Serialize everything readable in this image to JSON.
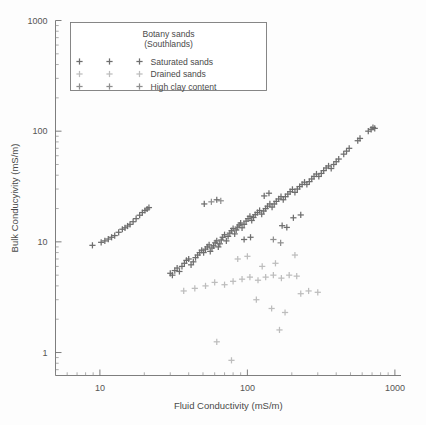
{
  "chart_data": {
    "type": "scatter",
    "title": "",
    "xlabel": "Fluid Conductivity (mS/m)",
    "ylabel": "Bulk Conducyivity (mS/m)",
    "xscale": "log",
    "yscale": "log",
    "xlim": [
      5,
      1100
    ],
    "ylim": [
      0.62,
      1000
    ],
    "xticks": [
      10,
      100,
      1000
    ],
    "xticklabels": [
      "10",
      "100",
      "1000"
    ],
    "yticks": [
      1,
      10,
      100,
      1000
    ],
    "yticklabels": [
      "1",
      "10",
      "100",
      "1000"
    ],
    "grid": false,
    "legend": {
      "position": "upper-left",
      "title_line1": "Botany sands",
      "title_line2": "(Southlands)",
      "entries": [
        {
          "label": "Saturated sands",
          "color": "#6e6e6e",
          "marker": "plus"
        },
        {
          "label": "Drained sands",
          "color": "#bdbdbd",
          "marker": "plus"
        },
        {
          "label": "High clay content",
          "color": "#8f8f8f",
          "marker": "plus"
        }
      ]
    },
    "series": [
      {
        "name": "Saturated sands",
        "color": "#6e6e6e",
        "marker": "plus",
        "points": [
          [
            8.9,
            9.3
          ],
          [
            10.2,
            9.9
          ],
          [
            10.8,
            10.2
          ],
          [
            11.4,
            10.6
          ],
          [
            12.0,
            11.0
          ],
          [
            12.6,
            11.4
          ],
          [
            13.4,
            12.2
          ],
          [
            14.2,
            13.0
          ],
          [
            14.8,
            13.4
          ],
          [
            15.4,
            13.9
          ],
          [
            16.0,
            14.4
          ],
          [
            16.8,
            15.2
          ],
          [
            17.6,
            16.2
          ],
          [
            18.6,
            17.4
          ],
          [
            19.4,
            18.4
          ],
          [
            20.2,
            19.2
          ],
          [
            20.9,
            19.8
          ],
          [
            21.5,
            20.4
          ],
          [
            30.0,
            5.2
          ],
          [
            31.0,
            5.0
          ],
          [
            32.2,
            5.5
          ],
          [
            33.4,
            5.8
          ],
          [
            34.6,
            5.4
          ],
          [
            36.0,
            6.0
          ],
          [
            37.4,
            6.4
          ],
          [
            38.6,
            6.8
          ],
          [
            40.0,
            7.0
          ],
          [
            41.5,
            6.2
          ],
          [
            43.0,
            6.6
          ],
          [
            44.5,
            7.2
          ],
          [
            46.0,
            7.6
          ],
          [
            47.5,
            8.0
          ],
          [
            49.0,
            8.4
          ],
          [
            50.5,
            8.0
          ],
          [
            52.0,
            8.6
          ],
          [
            53.5,
            9.0
          ],
          [
            55.0,
            9.4
          ],
          [
            56.0,
            8.2
          ],
          [
            57.5,
            8.8
          ],
          [
            59.0,
            9.2
          ],
          [
            60.5,
            9.8
          ],
          [
            62.0,
            10.2
          ],
          [
            63.5,
            9.0
          ],
          [
            65.0,
            9.6
          ],
          [
            66.5,
            10.4
          ],
          [
            68.0,
            11.0
          ],
          [
            70.0,
            11.6
          ],
          [
            72.0,
            10.2
          ],
          [
            74.0,
            11.2
          ],
          [
            76.0,
            12.0
          ],
          [
            78.0,
            12.6
          ],
          [
            80.0,
            13.2
          ],
          [
            82.0,
            11.8
          ],
          [
            84.0,
            12.8
          ],
          [
            86.0,
            13.6
          ],
          [
            88.0,
            14.2
          ],
          [
            90.0,
            14.8
          ],
          [
            92.0,
            13.4
          ],
          [
            95.0,
            14.4
          ],
          [
            98.0,
            15.4
          ],
          [
            101.0,
            16.2
          ],
          [
            104.0,
            17.0
          ],
          [
            107.0,
            15.6
          ],
          [
            110.0,
            16.6
          ],
          [
            113.0,
            17.6
          ],
          [
            117.0,
            18.4
          ],
          [
            121.0,
            19.2
          ],
          [
            125.0,
            17.8
          ],
          [
            129.0,
            19.0
          ],
          [
            133.0,
            20.0
          ],
          [
            137.0,
            21.0
          ],
          [
            142.0,
            22.0
          ],
          [
            147.0,
            20.6
          ],
          [
            152.0,
            22.0
          ],
          [
            157.0,
            23.2
          ],
          [
            163.0,
            24.4
          ],
          [
            169.0,
            25.6
          ],
          [
            175.0,
            24.0
          ],
          [
            181.0,
            25.6
          ],
          [
            188.0,
            27.0
          ],
          [
            195.0,
            28.4
          ],
          [
            202.0,
            29.8
          ],
          [
            210.0,
            28.0
          ],
          [
            218.0,
            30.0
          ],
          [
            226.0,
            31.6
          ],
          [
            235.0,
            33.0
          ],
          [
            244.0,
            34.6
          ],
          [
            253.0,
            33.0
          ],
          [
            263.0,
            35.0
          ],
          [
            273.0,
            37.0
          ],
          [
            283.0,
            39.0
          ],
          [
            294.0,
            41.0
          ],
          [
            305.0,
            39.0
          ],
          [
            317.0,
            41.5
          ],
          [
            329.0,
            44.0
          ],
          [
            342.0,
            46.5
          ],
          [
            355.0,
            48.5
          ],
          [
            370.0,
            46.0
          ],
          [
            385.0,
            50.0
          ],
          [
            400.0,
            53.0
          ],
          [
            416.0,
            56.0
          ],
          [
            450.0,
            62.0
          ],
          [
            470.0,
            66.0
          ],
          [
            490.0,
            70.0
          ],
          [
            560.0,
            82.0
          ],
          [
            580.0,
            86.0
          ],
          [
            660.0,
            100.0
          ],
          [
            690.0,
            104.0
          ],
          [
            710.0,
            108.0
          ],
          [
            730.0,
            106.0
          ],
          [
            51.0,
            22.0
          ],
          [
            62.0,
            24.0
          ],
          [
            130.0,
            26.0
          ],
          [
            140.0,
            27.5
          ],
          [
            95.0,
            10.5
          ],
          [
            105.0,
            11.0
          ],
          [
            172.0,
            14.0
          ],
          [
            185.0,
            13.5
          ],
          [
            205.0,
            16.5
          ],
          [
            230.0,
            17.5
          ]
        ]
      },
      {
        "name": "Drained sands",
        "color": "#bdbdbd",
        "marker": "plus",
        "points": [
          [
            37.0,
            3.6
          ],
          [
            44.0,
            3.8
          ],
          [
            52.0,
            4.0
          ],
          [
            60.0,
            4.3
          ],
          [
            70.0,
            4.1
          ],
          [
            80.0,
            4.4
          ],
          [
            92.0,
            4.6
          ],
          [
            104.0,
            4.8
          ],
          [
            118.0,
            4.5
          ],
          [
            133.0,
            4.8
          ],
          [
            150.0,
            5.0
          ],
          [
            170.0,
            4.7
          ],
          [
            192.0,
            5.0
          ],
          [
            216.0,
            4.9
          ],
          [
            115.0,
            3.0
          ],
          [
            146.0,
            2.5
          ],
          [
            180.0,
            2.3
          ],
          [
            230.0,
            3.4
          ],
          [
            260.0,
            3.6
          ],
          [
            300.0,
            3.5
          ],
          [
            62.0,
            1.25
          ],
          [
            78.0,
            0.85
          ],
          [
            165.0,
            1.6
          ],
          [
            126.0,
            6.0
          ],
          [
            155.0,
            6.4
          ],
          [
            86.0,
            7.0
          ],
          [
            100.0,
            7.4
          ],
          [
            210.0,
            7.6
          ]
        ]
      },
      {
        "name": "High clay content",
        "color": "#8f8f8f",
        "marker": "plus",
        "points": [
          [
            57.0,
            23.0
          ],
          [
            66.0,
            23.5
          ],
          [
            150.0,
            10.5
          ],
          [
            168.0,
            9.8
          ]
        ]
      }
    ]
  }
}
